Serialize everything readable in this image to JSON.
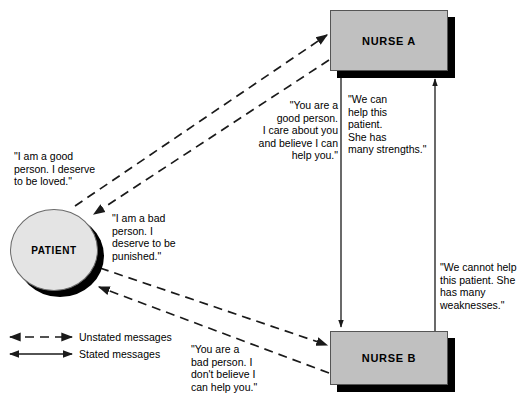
{
  "diagram": {
    "colors": {
      "box_fill": "#c0c0c0",
      "circle_fill": "#e4e4e4",
      "line": "#1a1a1a",
      "shadow": "#000000",
      "text": "#000000",
      "background": "#ffffff"
    },
    "nodes": [
      {
        "id": "patient",
        "label": "PATIENT",
        "shape": "circle"
      },
      {
        "id": "nurse_a",
        "label": "NURSE A",
        "shape": "rect"
      },
      {
        "id": "nurse_b",
        "label": "NURSE B",
        "shape": "rect"
      }
    ],
    "captions": [
      {
        "id": "patient-good-self",
        "text": "\"I am a good\nperson.  I deserve\nto be loved.\"",
        "align": "left",
        "from": "patient",
        "to": "nurse_a",
        "message_type": "unstated"
      },
      {
        "id": "patient-bad-self",
        "text": "\"I am a bad\nperson.  I\ndeserve to be\npunished.\"",
        "align": "left",
        "from": "patient",
        "to": "nurse_b",
        "message_type": "unstated"
      },
      {
        "id": "nurse-a-to-patient",
        "text": "\"You are a\ngood person.\nI care about you\nand believe I can\nhelp you.\"",
        "align": "right",
        "from": "nurse_a",
        "to": "patient",
        "message_type": "unstated"
      },
      {
        "id": "nurse-a-stated",
        "text": "\"We can\nhelp this\npatient.\nShe has\nmany strengths.\"",
        "align": "left",
        "from": "nurse_a",
        "to": "nurse_b",
        "message_type": "stated"
      },
      {
        "id": "nurse-b-stated",
        "text": "\"We cannot help\nthis patient.  She\nhas many\nweaknesses.\"",
        "align": "left",
        "from": "nurse_b",
        "to": "nurse_a",
        "message_type": "stated"
      },
      {
        "id": "nurse-b-to-patient",
        "text": "\"You are a\nbad person.  I\ndon't believe I\ncan help you.\"",
        "align": "left",
        "from": "nurse_b",
        "to": "patient",
        "message_type": "unstated"
      }
    ],
    "legend": {
      "items": [
        {
          "id": "unstated",
          "label": "Unstated messages",
          "style": "dashed-double-arrow"
        },
        {
          "id": "stated",
          "label": "Stated messages",
          "style": "solid-double-arrow"
        }
      ]
    }
  }
}
